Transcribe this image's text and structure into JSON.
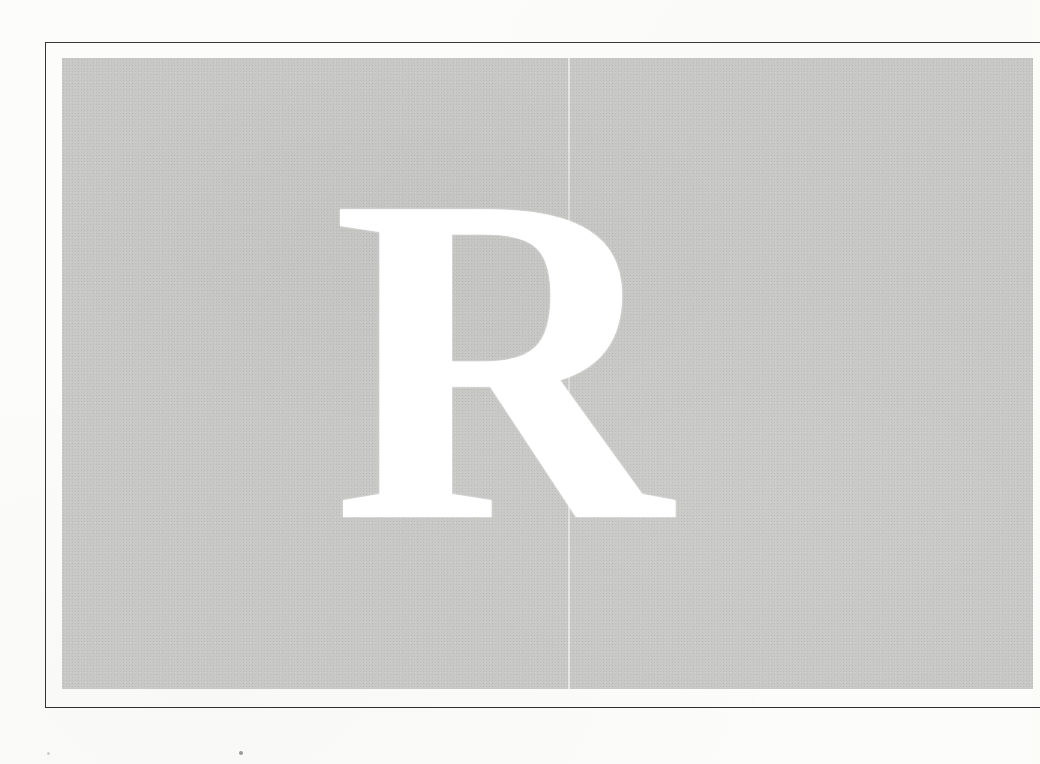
{
  "plate": {
    "letter": "R"
  },
  "colors": {
    "page_background": "#fcfcfa",
    "panel_gray": "#c8c9c7",
    "frame_line": "#343434",
    "letter_white": "#ffffff"
  }
}
